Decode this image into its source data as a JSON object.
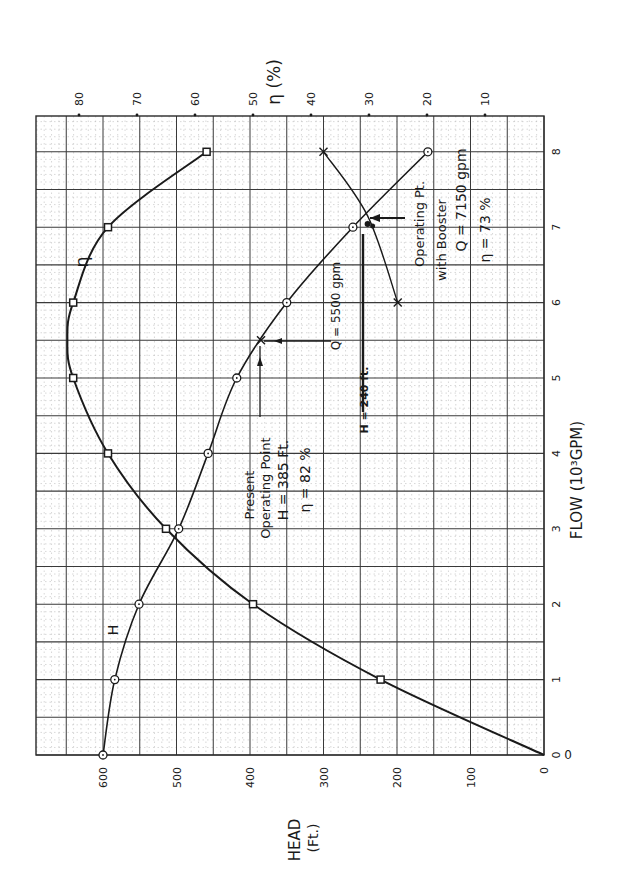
{
  "chart_data": {
    "type": "line",
    "orientation": "rotated-90-ccw",
    "xlabel": "FLOW (10³GPM)",
    "ylabel": "HEAD (Ft.)",
    "y2label": "η (%)",
    "xlim": [
      0,
      8
    ],
    "ylim": [
      0,
      600
    ],
    "y2lim": [
      0,
      80
    ],
    "grid": true,
    "flow_ticks": [
      "0",
      "1",
      "2",
      "3",
      "4",
      "5",
      "6",
      "7",
      "8"
    ],
    "head_ticks": [
      "600",
      "500",
      "400",
      "300",
      "200",
      "100",
      "0"
    ],
    "eff_ticks": [
      "80",
      "70",
      "60",
      "50",
      "40",
      "30",
      "20",
      "10"
    ],
    "series": [
      {
        "name": "H",
        "marker": "circle",
        "x": [
          0,
          1,
          2,
          3,
          4,
          5,
          6,
          7,
          8
        ],
        "values": [
          600,
          584,
          551,
          497,
          457,
          418,
          350,
          260,
          158
        ]
      },
      {
        "name": "η",
        "marker": "square",
        "x": [
          0,
          1,
          2,
          3,
          4,
          5,
          6,
          7,
          8
        ],
        "values": [
          0,
          28,
          50,
          65,
          75,
          81,
          81,
          75,
          58
        ]
      },
      {
        "name": "System curve",
        "marker": "x",
        "x": [
          6,
          7.15,
          8
        ],
        "values": [
          199,
          240,
          300
        ]
      }
    ],
    "annotations": [
      {
        "id": "present",
        "lines": [
          "Present",
          "Operating Point",
          "H = 385 Ft.",
          "η = 82 %"
        ],
        "flow": 5.5,
        "head": 385
      },
      {
        "id": "q5500",
        "text": "Q = 5500 gpm"
      },
      {
        "id": "h240",
        "text": "H = 240 ft."
      },
      {
        "id": "booster",
        "lines": [
          "Operating Pt.",
          "with Booster",
          "Q = 7150 gpm",
          "η = 73 %"
        ],
        "flow": 7.15,
        "head": 240
      }
    ]
  },
  "labels": {
    "eta_axis_title": "η (%)",
    "head_axis_title_1": "HEAD",
    "head_axis_title_2": "(Ft.)",
    "flow_axis_title": "FLOW (10³GPM)",
    "origin_zero": "0",
    "curve_h_label": "H",
    "curve_eta_label": "η",
    "present_1": "Present",
    "present_2": "Operating Point",
    "present_3": "H = 385 Ft.",
    "present_4": "η = 82 %",
    "q5500": "Q = 5500 gpm",
    "h240": "H = 240 ft.",
    "booster_1": "Operating Pt.",
    "booster_2": "with Booster",
    "booster_3": "Q = 7150 gpm",
    "booster_4": "η = 73 %"
  },
  "style": {
    "ink": "#1a1a1a",
    "grid_major": "#3a3a3a",
    "grid_minor": "#b0b0b0",
    "paper": "#ffffff"
  }
}
